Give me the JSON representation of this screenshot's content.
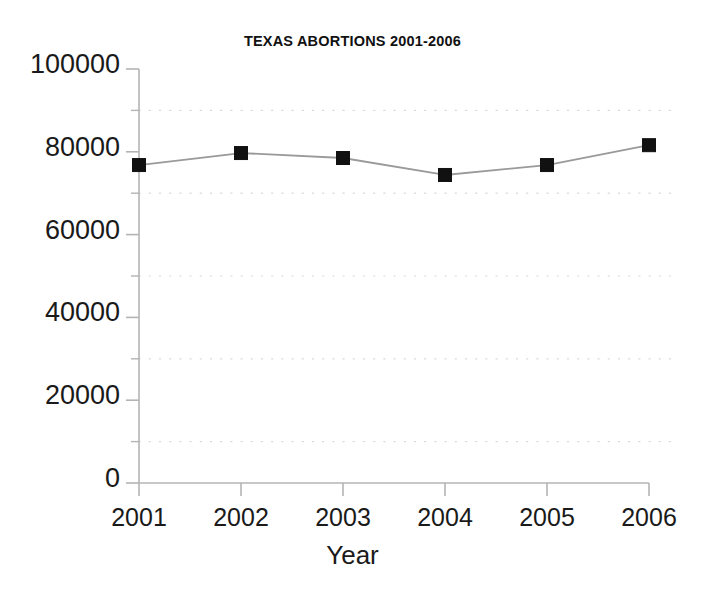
{
  "chart_data": {
    "type": "line",
    "title": "TEXAS ABORTIONS 2001-2006",
    "xlabel": "Year",
    "ylabel": "",
    "categories": [
      "2001",
      "2002",
      "2003",
      "2004",
      "2005",
      "2006"
    ],
    "values": [
      76800,
      79700,
      78500,
      74400,
      76800,
      81600
    ],
    "series": [
      {
        "name": "Texas abortions",
        "values": [
          76800,
          79700,
          78500,
          74400,
          76800,
          81600
        ]
      }
    ],
    "ylim": [
      0,
      100000
    ],
    "ytick_labels": [
      "0",
      "20000",
      "40000",
      "60000",
      "80000",
      "100000"
    ],
    "ytick_values": [
      0,
      20000,
      40000,
      60000,
      80000,
      100000
    ],
    "minor_ytick_values": [
      10000,
      30000,
      50000,
      70000,
      90000
    ],
    "xtick_labels": [
      "2001",
      "2002",
      "2003",
      "2004",
      "2005",
      "2006"
    ],
    "grid": "horizontal-dotted-minor",
    "legend": "none",
    "marker": "square",
    "marker_color": "#111111",
    "line_color": "#9a9a9a",
    "axis_color": "#b4b4b4",
    "gridline_color": "#d8d8d8",
    "background_color": "#ffffff"
  }
}
